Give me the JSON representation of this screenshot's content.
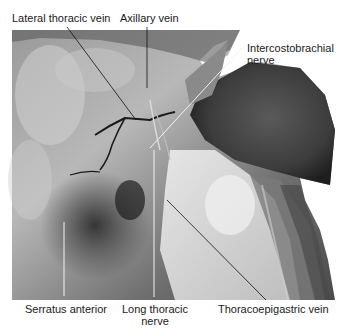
{
  "figure": {
    "type": "anatomical-photograph",
    "labels": [
      {
        "id": "lateral-thoracic-vein",
        "text": "Lateral thoracic vein"
      },
      {
        "id": "axillary-vein",
        "text": "Axillary vein"
      },
      {
        "id": "intercostobrachial-nerve",
        "line1": "Intercostobrachial",
        "line2": "nerve"
      },
      {
        "id": "serratus-anterior",
        "text": "Serratus anterior"
      },
      {
        "id": "long-thoracic-nerve",
        "line1": "Long thoracic",
        "line2": "nerve"
      },
      {
        "id": "thoracoepigastric-vein",
        "text": "Thoracoepigastric vein"
      }
    ],
    "colors": {
      "background": "#ffffff",
      "label_text": "#1a1a1a",
      "leader_dark": "#111111",
      "leader_light": "#f2f2f2"
    }
  }
}
